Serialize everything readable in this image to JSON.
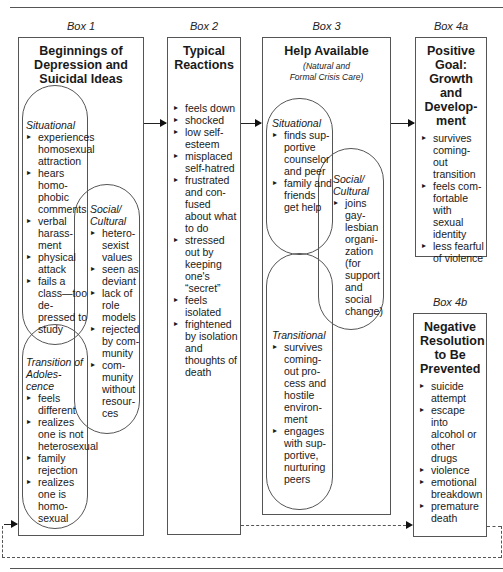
{
  "box1": {
    "label": "Box 1",
    "title": "Beginnings of Depression and Suicidal Ideas",
    "situational": {
      "title": "Situational",
      "items": [
        "experiences homosexual attraction",
        "hears homo-phobic comments",
        "verbal harass-ment",
        "physical attack",
        "fails a class—too de-pressed to study"
      ]
    },
    "social": {
      "title": "Social/ Cultural",
      "items": [
        "hetero-sexist values",
        "seen as deviant",
        "lack of role models",
        "rejected by com-munity",
        "com-munity without resour-ces"
      ]
    },
    "transition": {
      "title": "Transition of Adoles-cence",
      "items": [
        "feels different",
        "realizes one is not heterosexual",
        "family rejection",
        "realizes one is homo-sexual"
      ]
    }
  },
  "box2": {
    "label": "Box 2",
    "title": "Typical Reactions",
    "items": [
      "feels down",
      "shocked",
      "low self-esteem",
      "misplaced self-hatred",
      "frustrated and con-fused about what to do",
      "stressed out by keeping one's “secret”",
      "feels isolated",
      "frightened by isolation and thoughts of death"
    ]
  },
  "box3": {
    "label": "Box 3",
    "title": "Help Available",
    "subtitle": "(Natural and Formal Crisis Care)",
    "situational": {
      "title": "Situational",
      "items": [
        "finds sup-portive counselor and peer",
        "family and friends get help"
      ]
    },
    "social": {
      "title": "Social/ Cultural",
      "items": [
        "joins gay-lesbian organi-zation (for support and social change)"
      ]
    },
    "transitional": {
      "title": "Transitional",
      "items": [
        "survives coming-out pro-cess and hostile environ-ment",
        "engages with sup-portive, nurturing peers"
      ]
    }
  },
  "box4a": {
    "label": "Box 4a",
    "title": "Positive Goal: Growth and Develop-ment",
    "items": [
      "survives coming-out transition",
      "feels com-fortable with sexual identity",
      "less fearful of violence"
    ]
  },
  "box4b": {
    "label": "Box 4b",
    "title": "Negative Resolution to Be Prevented",
    "items": [
      "suicide attempt",
      "escape into alcohol or other drugs",
      "violence",
      "emotional breakdown",
      "premature death"
    ]
  }
}
